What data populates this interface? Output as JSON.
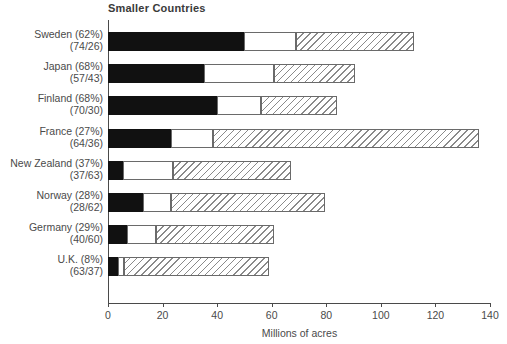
{
  "chart_data": {
    "type": "bar",
    "orientation": "horizontal",
    "stacked": true,
    "title": "Smaller Countries",
    "xlabel": "Millions of acres",
    "ylabel": "",
    "xlim": [
      0,
      140
    ],
    "xticks": [
      0,
      20,
      40,
      60,
      80,
      100,
      120,
      140
    ],
    "xtick_labels": [
      "0",
      "20",
      "40",
      "60",
      "80",
      "100",
      "120",
      "140"
    ],
    "grid": false,
    "legend": "none",
    "series": [
      {
        "name": "segment-1",
        "fill": "solid-black",
        "color": "#111111"
      },
      {
        "name": "segment-2",
        "fill": "open-white",
        "color": "#ffffff"
      },
      {
        "name": "segment-3",
        "fill": "diagonal-hatch",
        "color": "#ffffff"
      }
    ],
    "categories": [
      "Sweden (62%) (74/26)",
      "Japan (68%) (57/43)",
      "Finland (68%) (70/30)",
      "France (27%) (64/36)",
      "New Zealand (37%) (37/63)",
      "Norway (28%) (28/62)",
      "Germany (29%) (40/60)",
      "U.K. (8%) (63/37)"
    ],
    "rows": [
      {
        "country": "Sweden",
        "label_line1": "Sweden (62%)",
        "label_line2": "(74/26)",
        "percent": 62,
        "ratio": "74/26",
        "seg1": 50,
        "seg2": 19,
        "seg3": 43,
        "cum1": 50,
        "cum2": 69,
        "total": 112
      },
      {
        "country": "Japan",
        "label_line1": "Japan (68%)",
        "label_line2": "(57/43)",
        "percent": 68,
        "ratio": "57/43",
        "seg1": 35,
        "seg2": 26,
        "seg3": 29.5,
        "cum1": 35,
        "cum2": 61,
        "total": 90.5
      },
      {
        "country": "Finland",
        "label_line1": "Finland (68%)",
        "label_line2": "(70/30)",
        "percent": 68,
        "ratio": "70/30",
        "seg1": 40,
        "seg2": 16,
        "seg3": 28,
        "cum1": 40,
        "cum2": 56,
        "total": 84
      },
      {
        "country": "France",
        "label_line1": "France (27%)",
        "label_line2": "(64/36)",
        "percent": 27,
        "ratio": "64/36",
        "seg1": 23,
        "seg2": 15.5,
        "seg3": 97.5,
        "cum1": 23,
        "cum2": 38.5,
        "total": 136
      },
      {
        "country": "New Zealand",
        "label_line1": "New Zealand (37%)",
        "label_line2": "(37/63)",
        "percent": 37,
        "ratio": "37/63",
        "seg1": 5.5,
        "seg2": 18.5,
        "seg3": 43,
        "cum1": 5.5,
        "cum2": 24,
        "total": 67
      },
      {
        "country": "Norway",
        "label_line1": "Norway (28%)",
        "label_line2": "(28/62)",
        "percent": 28,
        "ratio": "28/62",
        "seg1": 13,
        "seg2": 10,
        "seg3": 56.5,
        "cum1": 13,
        "cum2": 23,
        "total": 79.5
      },
      {
        "country": "Germany",
        "label_line1": "Germany (29%)",
        "label_line2": "(40/60)",
        "percent": 29,
        "ratio": "40/60",
        "seg1": 7,
        "seg2": 10.5,
        "seg3": 43.5,
        "cum1": 7,
        "cum2": 17.5,
        "total": 61
      },
      {
        "country": "U.K.",
        "label_line1": "U.K. (8%)",
        "label_line2": "(63/37)",
        "percent": 8,
        "ratio": "63/37",
        "seg1": 3.5,
        "seg2": 2.5,
        "seg3": 53,
        "cum1": 3.5,
        "cum2": 6,
        "total": 59
      }
    ]
  }
}
